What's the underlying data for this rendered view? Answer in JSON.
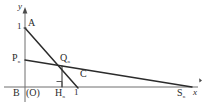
{
  "figure": {
    "type": "geometry-diagram",
    "axes": {
      "x_label": "x",
      "y_label": "y",
      "origin_label": "(O)",
      "x_axis_y": 87,
      "y_axis_x": 25,
      "x_axis_end": 201,
      "y_axis_top": 8
    },
    "ticks": [
      {
        "id": "tick-y-1",
        "label": "1",
        "axis": "y",
        "value": 1,
        "px": {
          "x": 18,
          "y": 23
        }
      },
      {
        "id": "tick-x-1",
        "label": "1",
        "axis": "x",
        "value": 1,
        "px": {
          "x": 75,
          "y": 89
        }
      }
    ],
    "points": [
      {
        "id": "point-A",
        "label": "A",
        "sub": "",
        "px": {
          "x": 25,
          "y": 28
        },
        "label_px": {
          "x": 28,
          "y": 19
        }
      },
      {
        "id": "point-P",
        "label": "P",
        "sub": "n",
        "px": {
          "x": 25,
          "y": 60
        },
        "label_px": {
          "x": 14,
          "y": 54
        }
      },
      {
        "id": "point-Q",
        "label": "Q",
        "sub": "n",
        "px": {
          "x": 62,
          "y": 66
        },
        "label_px": {
          "x": 61,
          "y": 56
        }
      },
      {
        "id": "point-B",
        "label": "B",
        "sub": "",
        "px": {
          "x": 25,
          "y": 87
        },
        "label_px": {
          "x": 15,
          "y": 89
        }
      },
      {
        "id": "point-H",
        "label": "H",
        "sub": "n",
        "px": {
          "x": 62,
          "y": 87
        },
        "label_px": {
          "x": 57,
          "y": 89
        }
      },
      {
        "id": "point-C",
        "label": "C",
        "sub": "",
        "px": {
          "x": 78,
          "y": 80
        },
        "label_px": {
          "x": 80,
          "y": 70
        }
      },
      {
        "id": "point-S",
        "label": "S",
        "sub": "n",
        "px": {
          "x": 191,
          "y": 87
        },
        "label_px": {
          "x": 178,
          "y": 89
        }
      }
    ],
    "segments": [
      {
        "id": "segment-A-to-x",
        "from": "A",
        "to_px": {
          "x": 78,
          "y": 87
        },
        "note": "steep line from A(0,1) to (1,0)"
      },
      {
        "id": "segment-P-to-S",
        "from": "P",
        "to_px": {
          "x": 191,
          "y": 87
        },
        "note": "shallow line from P to S"
      },
      {
        "id": "segment-Q-to-H",
        "from": "Q",
        "to_px": {
          "x": 62,
          "y": 87
        },
        "note": "perpendicular foot from Q to x-axis"
      }
    ],
    "markers": [
      {
        "id": "right-angle-marker",
        "label": "right-angle",
        "px": {
          "x": 56,
          "y": 81
        },
        "size": 6
      }
    ],
    "colors": {
      "stroke": "#2b2b2b",
      "axis": "#6b6b6b",
      "background": "#ffffff"
    }
  }
}
